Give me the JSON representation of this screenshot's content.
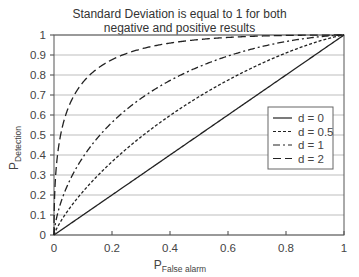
{
  "chart_data": {
    "type": "line",
    "title_lines": [
      "Standard Deviation is equal to 1 for both",
      "negative and positive results"
    ],
    "xlabel": "P",
    "xlabel_sub": "False alarm",
    "ylabel": "P",
    "ylabel_sub": "Detection",
    "xlim": [
      0,
      1
    ],
    "ylim": [
      0,
      1
    ],
    "x_ticks": [
      "0",
      "0.2",
      "0.4",
      "0.6",
      "0.8",
      "1"
    ],
    "y_ticks": [
      "0",
      "0.1",
      "0.2",
      "0.3",
      "0.4",
      "0.5",
      "0.6",
      "0.7",
      "0.8",
      "0.9",
      "1"
    ],
    "grid": "horizontal",
    "legend_position": "center-right",
    "x": [
      0,
      0.01,
      0.02,
      0.05,
      0.1,
      0.2,
      0.3,
      0.4,
      0.5,
      0.6,
      0.7,
      0.8,
      0.9,
      1.0
    ],
    "series": [
      {
        "name": "d = 0",
        "style": "solid",
        "values": [
          0,
          0.01,
          0.02,
          0.05,
          0.1,
          0.2,
          0.3,
          0.4,
          0.5,
          0.6,
          0.7,
          0.8,
          0.9,
          1.0
        ]
      },
      {
        "name": "d = 0.5",
        "style": "dotted",
        "values": [
          0,
          0.034,
          0.06,
          0.126,
          0.217,
          0.366,
          0.49,
          0.598,
          0.691,
          0.774,
          0.847,
          0.91,
          0.963,
          1.0
        ]
      },
      {
        "name": "d = 1",
        "style": "dash-dot",
        "values": [
          0,
          0.092,
          0.146,
          0.259,
          0.389,
          0.563,
          0.683,
          0.772,
          0.841,
          0.895,
          0.936,
          0.967,
          0.989,
          1.0
        ]
      },
      {
        "name": "d = 2",
        "style": "dashed",
        "values": [
          0,
          0.372,
          0.479,
          0.639,
          0.764,
          0.877,
          0.93,
          0.96,
          0.977,
          0.988,
          0.994,
          0.998,
          0.9995,
          1.0
        ]
      }
    ]
  },
  "legend": {
    "items": [
      "d = 0",
      "d = 0.5",
      "d = 1",
      "d = 2"
    ]
  }
}
